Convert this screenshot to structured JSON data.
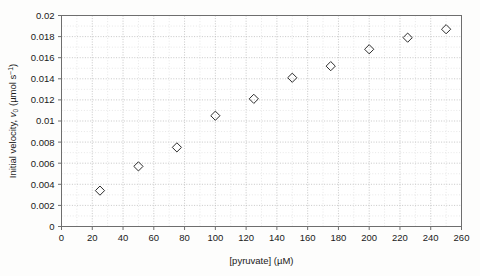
{
  "chart_data": {
    "type": "scatter",
    "title": "",
    "xlabel": "[pyruvate] (µM)",
    "ylabel": "Initial velocity, v0 (µmol s-1)",
    "ylabel_parts": {
      "prefix": "Initial velocity, ",
      "symbol": "v",
      "subscript": "0",
      "units_open": " (µmol s",
      "superscript": "−1",
      "units_close": ")"
    },
    "xlim": [
      0,
      260
    ],
    "ylim": [
      0,
      0.02
    ],
    "xticks": [
      0,
      20,
      40,
      60,
      80,
      100,
      120,
      140,
      160,
      180,
      200,
      220,
      240,
      260
    ],
    "xtick_labels": [
      "0",
      "20",
      "40",
      "60",
      "80",
      "100",
      "120",
      "140",
      "160",
      "180",
      "200",
      "220",
      "240",
      "260"
    ],
    "yticks": [
      0,
      0.002,
      0.004,
      0.006,
      0.008,
      0.01,
      0.012,
      0.014,
      0.016,
      0.018,
      0.02
    ],
    "ytick_labels": [
      "0",
      "0.002",
      "0.004",
      "0.006",
      "0.008",
      "0.01",
      "0.012",
      "0.014",
      "0.016",
      "0.018",
      "0.02"
    ],
    "grid": true,
    "grid_minor": true,
    "legend": false,
    "marker": "open-diamond",
    "x": [
      25,
      50,
      75,
      100,
      125,
      150,
      175,
      200,
      225,
      250
    ],
    "y": [
      0.0034,
      0.0057,
      0.0075,
      0.0105,
      0.0121,
      0.0141,
      0.0152,
      0.0168,
      0.0179,
      0.0187
    ],
    "points": [
      {
        "x": 25,
        "y": 0.0034
      },
      {
        "x": 50,
        "y": 0.0057
      },
      {
        "x": 75,
        "y": 0.0075
      },
      {
        "x": 100,
        "y": 0.0105
      },
      {
        "x": 125,
        "y": 0.0121
      },
      {
        "x": 150,
        "y": 0.0141
      },
      {
        "x": 175,
        "y": 0.0152
      },
      {
        "x": 200,
        "y": 0.0168
      },
      {
        "x": 225,
        "y": 0.0179
      },
      {
        "x": 250,
        "y": 0.0187
      }
    ],
    "colors": {
      "marker_stroke": "#2b2b2b",
      "frame": "#6e6e6e",
      "grid_major": "#b9b9b9",
      "grid_minor": "#d6d6d6",
      "background": "#fdfdfc",
      "text": "#1a1a1a"
    }
  }
}
